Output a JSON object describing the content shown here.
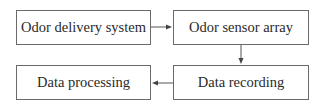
{
  "diagram": {
    "type": "flowchart",
    "nodes": [
      {
        "id": "delivery",
        "label": "Odor delivery system"
      },
      {
        "id": "sensor",
        "label": "Odor sensor array"
      },
      {
        "id": "recording",
        "label": "Data recording"
      },
      {
        "id": "processing",
        "label": "Data processing"
      }
    ],
    "edges": [
      {
        "from": "delivery",
        "to": "sensor",
        "direction": "right"
      },
      {
        "from": "sensor",
        "to": "recording",
        "direction": "down"
      },
      {
        "from": "recording",
        "to": "processing",
        "direction": "left"
      }
    ],
    "colors": {
      "stroke": "#6a6a6a",
      "text": "#2a2a2a",
      "background": "#ffffff"
    }
  }
}
